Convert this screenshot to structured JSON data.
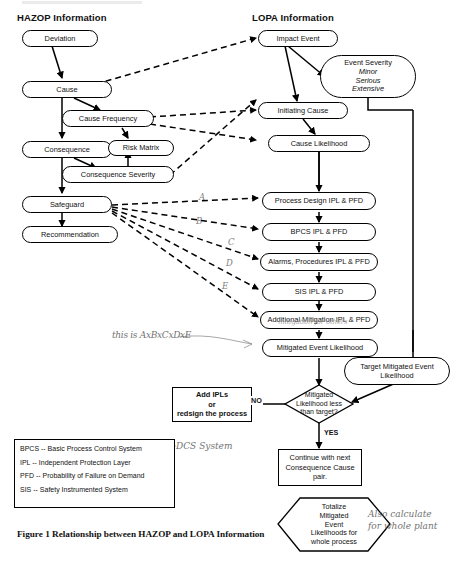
{
  "figure": {
    "caption": "Figure 1 Relationship between HAZOP and LOPA Information",
    "columns": {
      "hazop_heading": "HAZOP Information",
      "lopa_heading": "LOPA Information"
    }
  },
  "hazop_nodes": [
    {
      "id": "deviation",
      "label": "Deviation"
    },
    {
      "id": "cause",
      "label": "Cause"
    },
    {
      "id": "cause-frequency",
      "label": "Cause Frequency"
    },
    {
      "id": "consequence",
      "label": "Consequence"
    },
    {
      "id": "risk-matrix",
      "label": "Risk Matrix"
    },
    {
      "id": "consequence-severity",
      "label": "Consequence Severity"
    },
    {
      "id": "safeguard",
      "label": "Safeguard"
    },
    {
      "id": "recommendation",
      "label": "Recommendation"
    }
  ],
  "lopa_nodes": [
    {
      "id": "impact-event",
      "label": "Impact Event"
    },
    {
      "id": "initiating-cause",
      "label": "Initiating Cause"
    },
    {
      "id": "cause-likelihood",
      "label": "Cause Likelihood"
    },
    {
      "id": "process-design-ipl",
      "label": "Process Design IPL & PFD"
    },
    {
      "id": "bpcs-ipl",
      "label": "BPCS IPL & PFD"
    },
    {
      "id": "alarms-ipl",
      "label": "Alarms, Procedures IPL & PFD"
    },
    {
      "id": "sis-ipl",
      "label": "SIS IPL & PFD"
    },
    {
      "id": "additional-mitigation-ipl",
      "label": "Additional Mitigation IPL & PFD"
    },
    {
      "id": "mitigated-event-likelihood",
      "label": "Mitigated Event Likelihood"
    },
    {
      "id": "target-mitigated-event-likelihood",
      "label": "Target Mitigated Event Likelihood"
    }
  ],
  "event_severity": {
    "title": "Event Severity",
    "items": [
      "Minor",
      "Serious",
      "Extensive"
    ]
  },
  "decision": {
    "label": "Mitigated Likelihood less than target?",
    "line1": "Mitigated",
    "line2": "Likelihood less",
    "line3": "than target?",
    "no_label": "NO",
    "yes_label": "YES"
  },
  "process_boxes": {
    "add_ipls": {
      "line1": "Add IPLs",
      "line2": "or",
      "line3": "redsign the process"
    },
    "continue": {
      "line1": "Continue with next",
      "line2": "Consequence Cause",
      "line3": "pair."
    },
    "totalize": {
      "line1": "Totalize",
      "line2": "Mitigated",
      "line3": "Event",
      "line4": "Likelihoods for",
      "line5": "whole process"
    }
  },
  "legend": {
    "rows": [
      "BPCS -- Basic Process Control System",
      "IPL -- Independent Protection Layer",
      "PFD -- Probability of Failure on Demand",
      "SIS -- Safety Instrumented System"
    ]
  },
  "annotations": {
    "safeguard_links": [
      "A",
      "B",
      "C",
      "D",
      "E"
    ],
    "formula": "this is AxBxCxDxE",
    "dcs": "DCS System",
    "whole_plant_line1": "Also calculate",
    "whole_plant_line2": "for whole plant",
    "additional_mitigation_scribble": "mitigation for others"
  },
  "colors": {
    "stroke": "#000000",
    "background": "#ffffff",
    "handwriting": "#5a5a5a"
  }
}
